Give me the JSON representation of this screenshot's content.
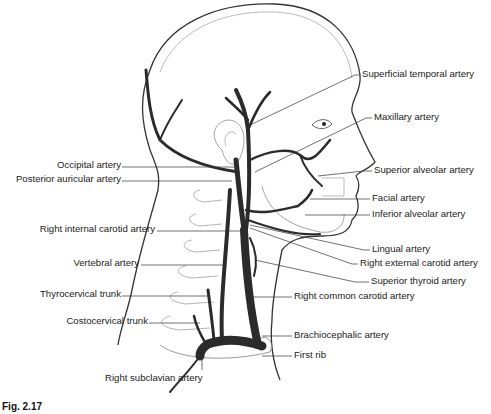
{
  "figure": {
    "caption": "Fig. 2.17"
  },
  "labels_left": [
    {
      "text": "Occipital artery",
      "x": 121,
      "y": 164
    },
    {
      "text": "Posterior auricular artery",
      "x": 121,
      "y": 178
    },
    {
      "text": "Right internal carotid artery",
      "x": 156,
      "y": 228
    },
    {
      "text": "Vertebral artery",
      "x": 140,
      "y": 262
    },
    {
      "text": "Thyrocervical trunk",
      "x": 121,
      "y": 293
    },
    {
      "text": "Costocervical trunk",
      "x": 148,
      "y": 320
    },
    {
      "text": "Right subclavian artery",
      "x": 105,
      "y": 377
    }
  ],
  "labels_right": [
    {
      "text": "Superficial temporal artery",
      "x": 362,
      "y": 72
    },
    {
      "text": "Maxillary artery",
      "x": 374,
      "y": 115
    },
    {
      "text": "Superior alveolar artery",
      "x": 374,
      "y": 168
    },
    {
      "text": "Facial artery",
      "x": 372,
      "y": 196
    },
    {
      "text": "Inferior alveolar artery",
      "x": 372,
      "y": 212
    },
    {
      "text": "Lingual artery",
      "x": 372,
      "y": 247
    },
    {
      "text": "Right external carotid artery",
      "x": 360,
      "y": 261
    },
    {
      "text": "Superior thyroid artery",
      "x": 371,
      "y": 279
    },
    {
      "text": "Right common carotid artery",
      "x": 294,
      "y": 294
    },
    {
      "text": "Brachiocephalic artery",
      "x": 294,
      "y": 333
    },
    {
      "text": "First rib",
      "x": 294,
      "y": 353
    }
  ],
  "colors": {
    "artery": "#2b2b2b",
    "outline": "#3a3a3a",
    "bone": "#9a9a9a",
    "leader": "#333333"
  }
}
